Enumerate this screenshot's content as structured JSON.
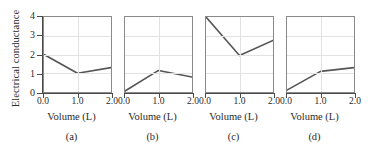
{
  "figure": {
    "ylabel": "Electrical conductance",
    "background": "#ffffff",
    "line_color": "#555555",
    "axis_color": "#4a4a4a",
    "grid_color": "#e2e2e2"
  },
  "chart_data": [
    {
      "type": "line",
      "panel": "a",
      "caption": "(a)",
      "title": "",
      "xlabel": "Volume (L)",
      "ylabel": "Electrical conductance",
      "xlim": [
        0.0,
        2.0
      ],
      "ylim": [
        0,
        4
      ],
      "xticks": [
        0.0,
        1.0,
        2.0
      ],
      "xticklabels": [
        "0.0",
        "1.0",
        "2.0"
      ],
      "yticks": [
        0,
        1,
        2,
        3,
        4
      ],
      "yticklabels": [
        "0",
        "1",
        "2",
        "3",
        "4"
      ],
      "grid": true,
      "legend": "none",
      "x": [
        0.0,
        1.0,
        2.0
      ],
      "values": [
        2.0,
        1.0,
        1.3
      ]
    },
    {
      "type": "line",
      "panel": "b",
      "caption": "(b)",
      "title": "",
      "xlabel": "Volume (L)",
      "ylabel": "Electrical conductance",
      "xlim": [
        0.0,
        2.0
      ],
      "ylim": [
        0,
        4
      ],
      "xticks": [
        0.0,
        1.0,
        2.0
      ],
      "xticklabels": [
        "0.0",
        "1.0",
        "2.0"
      ],
      "yticks": [
        0,
        1,
        2,
        3,
        4
      ],
      "yticklabels": [
        "0",
        "1",
        "2",
        "3",
        "4"
      ],
      "grid": true,
      "legend": "none",
      "x": [
        0.0,
        1.0,
        2.0
      ],
      "values": [
        0.05,
        1.15,
        0.8
      ]
    },
    {
      "type": "line",
      "panel": "c",
      "caption": "(c)",
      "title": "",
      "xlabel": "Volume (L)",
      "ylabel": "Electrical conductance",
      "xlim": [
        0.0,
        2.0
      ],
      "ylim": [
        0,
        4
      ],
      "xticks": [
        0.0,
        1.0,
        2.0
      ],
      "xticklabels": [
        "0.0",
        "1.0",
        "2.0"
      ],
      "yticks": [
        0,
        1,
        2,
        3,
        4
      ],
      "yticklabels": [
        "0",
        "1",
        "2",
        "3",
        "4"
      ],
      "grid": true,
      "legend": "none",
      "x": [
        0.0,
        1.0,
        2.0
      ],
      "values": [
        4.0,
        1.95,
        2.75
      ]
    },
    {
      "type": "line",
      "panel": "d",
      "caption": "(d)",
      "title": "",
      "xlabel": "Volume (L)",
      "ylabel": "Electrical conductance",
      "xlim": [
        0.0,
        2.0
      ],
      "ylim": [
        0,
        4
      ],
      "xticks": [
        0.0,
        1.0,
        2.0
      ],
      "xticklabels": [
        "0.0",
        "1.0",
        "2.0"
      ],
      "yticks": [
        0,
        1,
        2,
        3,
        4
      ],
      "yticklabels": [
        "0",
        "1",
        "2",
        "3",
        "4"
      ],
      "grid": true,
      "legend": "none",
      "x": [
        0.0,
        1.0,
        2.0
      ],
      "values": [
        0.1,
        1.1,
        1.3
      ]
    }
  ]
}
